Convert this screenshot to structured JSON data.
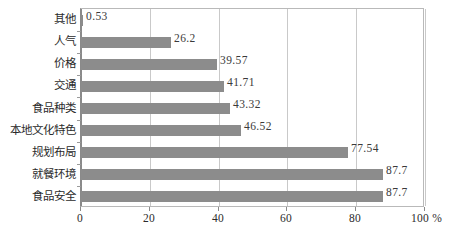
{
  "chart_data": {
    "type": "bar",
    "orientation": "horizontal",
    "title": "",
    "subtitle": "",
    "xlabel": "%",
    "ylabel": "",
    "categories": [
      "其他",
      "人气",
      "价格",
      "交通",
      "食品种类",
      "本地文化特色",
      "规划布局",
      "就餐环境",
      "食品安全"
    ],
    "values": [
      0.53,
      26.2,
      39.57,
      41.71,
      43.32,
      46.52,
      77.54,
      87.7,
      87.7
    ],
    "value_labels": [
      "0.53",
      "26.2",
      "39.57",
      "41.71",
      "43.32",
      "46.52",
      "77.54",
      "87.7",
      "87.7"
    ],
    "xlim": [
      0,
      100
    ],
    "xticks": [
      0,
      20,
      40,
      60,
      80,
      100
    ],
    "xtick_labels": [
      "0",
      "20",
      "40",
      "60",
      "80",
      "100 %"
    ],
    "grid": true,
    "grid_axis": "x",
    "legend": "none",
    "bar_color": "#8c8c8c",
    "grid_color": "#c9c9c9",
    "axis_color": "#8a8a8a",
    "background": "#ffffff"
  }
}
